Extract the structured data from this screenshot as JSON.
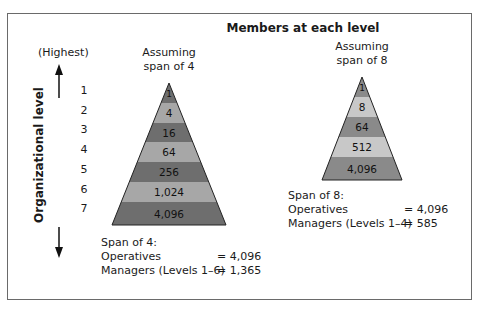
{
  "title": "Members at each level",
  "axis": {
    "top_label": "(Highest)",
    "label": "Organizational level",
    "levels": [
      "1",
      "2",
      "3",
      "4",
      "5",
      "6",
      "7"
    ]
  },
  "left_pyramid": {
    "caption_line1": "Assuming",
    "caption_line2": "span of 4",
    "bands": [
      {
        "label": "1",
        "color": "#6e6e6e"
      },
      {
        "label": "4",
        "color": "#a7a7a7"
      },
      {
        "label": "16",
        "color": "#6e6e6e"
      },
      {
        "label": "64",
        "color": "#a7a7a7"
      },
      {
        "label": "256",
        "color": "#6e6e6e"
      },
      {
        "label": "1,024",
        "color": "#a7a7a7"
      },
      {
        "label": "4,096",
        "color": "#6e6e6e"
      }
    ],
    "summary": {
      "heading": "Span of 4:",
      "rows": [
        {
          "label": "Operatives",
          "value": "= 4,096"
        },
        {
          "label": "Managers (Levels 1–6)",
          "value": "= 1,365"
        }
      ]
    }
  },
  "right_pyramid": {
    "caption_line1": "Assuming",
    "caption_line2": "span of 8",
    "bands": [
      {
        "label": "1",
        "color": "#8a8a8a"
      },
      {
        "label": "8",
        "color": "#c8c8c8"
      },
      {
        "label": "64",
        "color": "#8a8a8a"
      },
      {
        "label": "512",
        "color": "#c8c8c8"
      },
      {
        "label": "4,096",
        "color": "#8a8a8a"
      }
    ],
    "summary": {
      "heading": "Span of 8:",
      "rows": [
        {
          "label": "Operatives",
          "value": "= 4,096"
        },
        {
          "label": "Managers (Levels 1–4)",
          "value": "= 585"
        }
      ]
    }
  }
}
